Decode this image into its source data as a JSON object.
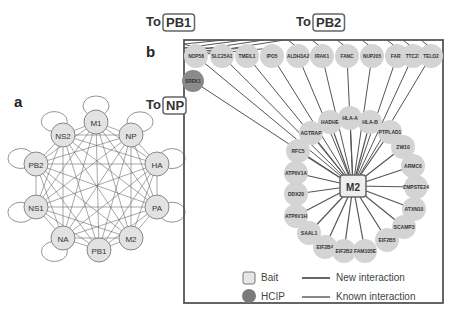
{
  "panel_a": {
    "label": "a",
    "nodes": [
      {
        "id": "M1",
        "x": 96,
        "y": 122
      },
      {
        "id": "NS2",
        "x": 63,
        "y": 135
      },
      {
        "id": "NP",
        "x": 131,
        "y": 135
      },
      {
        "id": "PB2",
        "x": 36,
        "y": 164
      },
      {
        "id": "HA",
        "x": 157,
        "y": 164
      },
      {
        "id": "NS1",
        "x": 36,
        "y": 207
      },
      {
        "id": "PA",
        "x": 157,
        "y": 207
      },
      {
        "id": "NA",
        "x": 63,
        "y": 238
      },
      {
        "id": "PB1",
        "x": 99,
        "y": 250
      },
      {
        "id": "M2",
        "x": 131,
        "y": 238
      }
    ],
    "self_loops": [
      "M1",
      "NP",
      "NS2",
      "PB2",
      "NS1",
      "HA",
      "PA",
      "NA"
    ]
  },
  "panel_b": {
    "label": "b",
    "center": {
      "id": "M2",
      "x": 353,
      "y": 186
    },
    "to_labels": [
      {
        "prefix": "To",
        "target": "PB1",
        "x": 148,
        "y": 14
      },
      {
        "prefix": "To",
        "target": "PB2",
        "x": 298,
        "y": 14
      },
      {
        "prefix": "To",
        "target": "NP",
        "x": 148,
        "y": 97
      }
    ],
    "top_row": [
      {
        "id": "NOP58",
        "x": 196,
        "y": 56,
        "target": "PB1"
      },
      {
        "id": "SLC25A1",
        "x": 222,
        "y": 56,
        "target": "PB1"
      },
      {
        "id": "TMEIL1",
        "x": 247,
        "y": 56,
        "target": "PB1"
      },
      {
        "id": "IPO5",
        "x": 272,
        "y": 56,
        "target": "PB1"
      },
      {
        "id": "ALDH3A2",
        "x": 298,
        "y": 56,
        "target": "PB2"
      },
      {
        "id": "IRAK1",
        "x": 322,
        "y": 56,
        "target": "PB2"
      },
      {
        "id": "FANC",
        "x": 347,
        "y": 56,
        "target": "PB2"
      },
      {
        "id": "NUP205",
        "x": 372,
        "y": 56,
        "target": "PB2"
      },
      {
        "id": "FAR1",
        "x": 397,
        "y": 56,
        "target": "PB2"
      },
      {
        "id": "TTC27",
        "x": 413,
        "y": 56,
        "target": "PB2"
      },
      {
        "id": "TELO2",
        "x": 431,
        "y": 56,
        "target": "PB2"
      }
    ],
    "hcip": [
      {
        "id": "SREK1",
        "x": 193,
        "y": 81,
        "target": "NP"
      }
    ],
    "ring": [
      {
        "id": "HADHE",
        "x": 330,
        "y": 122
      },
      {
        "id": "HLA-A",
        "x": 350,
        "y": 118
      },
      {
        "id": "HLA-B",
        "x": 370,
        "y": 122
      },
      {
        "id": "AGTRAP",
        "x": 311,
        "y": 133
      },
      {
        "id": "PTPLAD1",
        "x": 390,
        "y": 132
      },
      {
        "id": "RFC5",
        "x": 298,
        "y": 151
      },
      {
        "id": "ZW10",
        "x": 403,
        "y": 147
      },
      {
        "id": "ATP6V1A",
        "x": 296,
        "y": 173
      },
      {
        "id": "ARMC6",
        "x": 413,
        "y": 166
      },
      {
        "id": "DDX20",
        "x": 296,
        "y": 194
      },
      {
        "id": "ZMPSTE24",
        "x": 416,
        "y": 187
      },
      {
        "id": "ATP6V1H",
        "x": 296,
        "y": 216
      },
      {
        "id": "ATXN10",
        "x": 414,
        "y": 209
      },
      {
        "id": "SAAL1",
        "x": 309,
        "y": 233
      },
      {
        "id": "SCAMP3",
        "x": 404,
        "y": 227
      },
      {
        "id": "EIF2B4",
        "x": 325,
        "y": 247
      },
      {
        "id": "EIF2B5",
        "x": 387,
        "y": 240
      },
      {
        "id": "EIF2B2",
        "x": 344,
        "y": 251
      },
      {
        "id": "FAM105E",
        "x": 365,
        "y": 251
      }
    ],
    "box": {
      "x": 184,
      "y": 40,
      "w": 259,
      "h": 263
    }
  },
  "legend": {
    "items": [
      {
        "symbol": "square",
        "label": "Bait"
      },
      {
        "symbol": "circle",
        "label": "HCIP"
      },
      {
        "symbol": "line",
        "label": "New interaction"
      },
      {
        "symbol": "line",
        "label": "Known interaction"
      }
    ]
  },
  "colors": {
    "node_fill": "#d4d4d4",
    "hcip_fill": "#8a8a8a",
    "edge": "#555555",
    "box_border": "#555555",
    "bait_border": "#666666"
  }
}
